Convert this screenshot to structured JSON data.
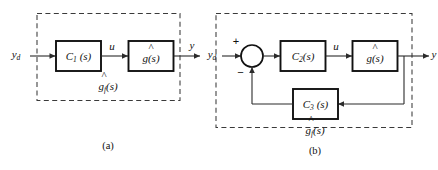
{
  "figure": {
    "stroke_color": "#2b2b2b",
    "block_border_color": "#111111",
    "dashed_color": "#3a3a3a",
    "background": "#ffffff"
  },
  "panel_a": {
    "caption": "(a)",
    "input_signal": {
      "base": "y",
      "subscript": "d",
      "text": "yd"
    },
    "blocks": [
      {
        "id": "c1",
        "label_base": "C",
        "label_subscript": "1",
        "label_arg": "(s)",
        "text": "C1(s)"
      },
      {
        "id": "ghat",
        "label_base": "g",
        "hat": true,
        "label_arg": "(s)",
        "text": "g(s)"
      }
    ],
    "internal_signal": {
      "text": "u"
    },
    "output_signal": {
      "text": "y"
    },
    "enclosure_label": {
      "base": "g",
      "hat": true,
      "subscript": "f",
      "arg": "(s)",
      "text": "gf(s)"
    }
  },
  "panel_b": {
    "caption": "(b)",
    "input_signal": {
      "base": "y",
      "subscript": "d",
      "text": "yd"
    },
    "summing_junction": {
      "positive_sign": "+",
      "negative_sign": "−"
    },
    "blocks": [
      {
        "id": "c2",
        "label_base": "C",
        "label_subscript": "2",
        "label_arg": "(s)",
        "text": "C2(s)"
      },
      {
        "id": "ghat",
        "label_base": "g",
        "hat": true,
        "label_arg": "(s)",
        "text": "g(s)"
      },
      {
        "id": "c3",
        "label_base": "C",
        "label_subscript": "3",
        "label_arg": "(s)",
        "text": "C3(s)"
      }
    ],
    "internal_signal": {
      "text": "u"
    },
    "output_signal": {
      "text": "y"
    },
    "enclosure_label": {
      "base": "g",
      "hat": true,
      "subscript": "f",
      "arg": "(s)",
      "text": "gf(s)"
    }
  }
}
